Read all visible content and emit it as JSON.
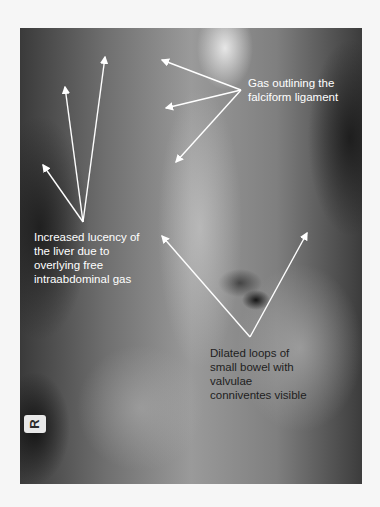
{
  "figure": {
    "type": "annotated abdominal radiograph",
    "side_marker": "R",
    "colors": {
      "background": "#f6f6f6",
      "arrow": "#ffffff",
      "label_light": "#ffffff",
      "label_dark": "#1e1e1e"
    }
  },
  "annotations": [
    {
      "id": "falciform",
      "lines": [
        "Gas outlining the",
        "falciform ligament"
      ],
      "arrow_count": 3
    },
    {
      "id": "liver",
      "lines": [
        "Increased lucency of",
        "the liver due to",
        "overlying free",
        "intraabdominal gas"
      ],
      "arrow_count": 3
    },
    {
      "id": "bowel",
      "lines": [
        "Dilated loops of",
        "small bowel with",
        "valvulae",
        "conniventes visible"
      ],
      "arrow_count": 2
    }
  ]
}
